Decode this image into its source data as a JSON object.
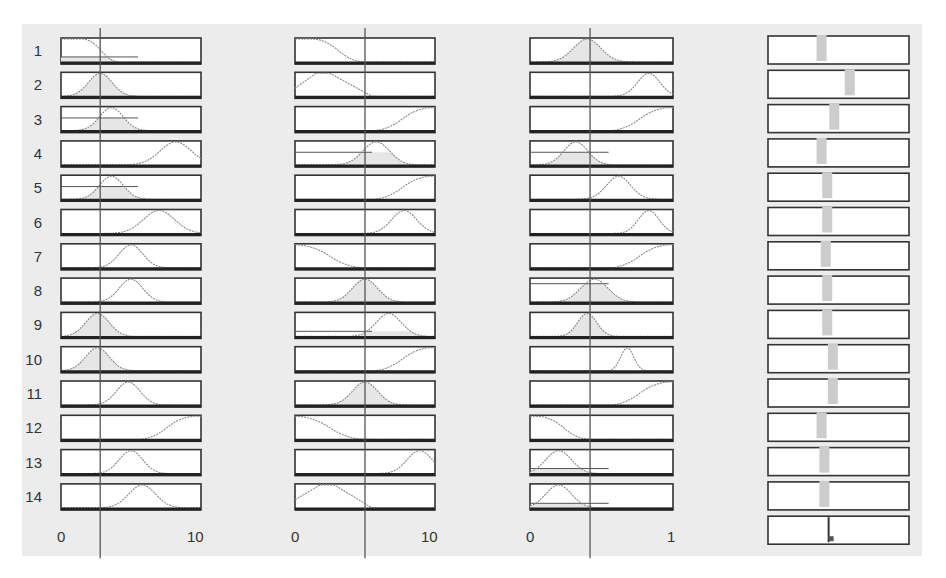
{
  "chart_data": {
    "type": "fuzzy-rule-viewer",
    "title": "",
    "rules": [
      "1",
      "2",
      "3",
      "4",
      "5",
      "6",
      "7",
      "8",
      "9",
      "10",
      "11",
      "12",
      "13",
      "14"
    ],
    "inputs": [
      {
        "name": "input1",
        "range": [
          0,
          10
        ],
        "tick_labels": [
          "0",
          "10"
        ],
        "current_value": 2.8,
        "membership": [
          {
            "rule": 1,
            "shape": "zmf",
            "params": [
              0,
              1.5,
              4.2
            ],
            "fired": 0.22
          },
          {
            "rule": 2,
            "shape": "gauss",
            "center": 2.8,
            "width": 1.5,
            "fired": 1.0
          },
          {
            "rule": 3,
            "shape": "gauss",
            "center": 3.6,
            "width": 1.5,
            "fired": 0.55
          },
          {
            "rule": 4,
            "shape": "gauss",
            "center": 8.2,
            "width": 2.0,
            "fired": 0.0
          },
          {
            "rule": 5,
            "shape": "gauss",
            "center": 3.6,
            "width": 1.5,
            "fired": 0.55
          },
          {
            "rule": 6,
            "shape": "gauss",
            "center": 7.0,
            "width": 2.0,
            "fired": 0.0
          },
          {
            "rule": 7,
            "shape": "gauss",
            "center": 5.0,
            "width": 1.5,
            "fired": 0.0
          },
          {
            "rule": 8,
            "shape": "gauss",
            "center": 5.0,
            "width": 1.5,
            "fired": 0.0
          },
          {
            "rule": 9,
            "shape": "gauss",
            "center": 2.6,
            "width": 1.5,
            "fired": 1.0
          },
          {
            "rule": 10,
            "shape": "gauss",
            "center": 2.6,
            "width": 1.5,
            "fired": 1.0
          },
          {
            "rule": 11,
            "shape": "gauss",
            "center": 4.8,
            "width": 1.5,
            "fired": 0.0
          },
          {
            "rule": 12,
            "shape": "smf",
            "params": [
              5.5,
              9.6
            ],
            "fired": 0.0
          },
          {
            "rule": 13,
            "shape": "gauss",
            "center": 5.0,
            "width": 1.5,
            "fired": 0.0
          },
          {
            "rule": 14,
            "shape": "gauss",
            "center": 5.8,
            "width": 1.7,
            "fired": 0.0
          }
        ]
      },
      {
        "name": "input2",
        "range": [
          0,
          10
        ],
        "tick_labels": [
          "0",
          "10"
        ],
        "current_value": 5.0,
        "membership": [
          {
            "rule": 1,
            "shape": "zmf",
            "params": [
              1.2,
              5.0
            ],
            "fired": 0.0
          },
          {
            "rule": 2,
            "shape": "trap",
            "params": [
              0,
              1.5,
              2.5,
              5.5
            ],
            "fired": 0.0
          },
          {
            "rule": 3,
            "shape": "smf",
            "params": [
              5.5,
              9.8
            ],
            "fired": 0.0
          },
          {
            "rule": 4,
            "shape": "gauss",
            "center": 5.8,
            "width": 1.7,
            "fired": 0.55
          },
          {
            "rule": 5,
            "shape": "smf",
            "params": [
              5.5,
              9.8
            ],
            "fired": 0.0
          },
          {
            "rule": 6,
            "shape": "gauss",
            "center": 7.8,
            "width": 1.6,
            "fired": 0.0
          },
          {
            "rule": 7,
            "shape": "zmf",
            "params": [
              0,
              5.0
            ],
            "fired": 0.0
          },
          {
            "rule": 8,
            "shape": "gauss",
            "center": 5.0,
            "width": 1.6,
            "fired": 1.0
          },
          {
            "rule": 9,
            "shape": "gauss",
            "center": 6.7,
            "width": 1.6,
            "fired": 0.22
          },
          {
            "rule": 10,
            "shape": "smf",
            "params": [
              5.5,
              9.8
            ],
            "fired": 0.0
          },
          {
            "rule": 11,
            "shape": "gauss",
            "center": 5.0,
            "width": 1.6,
            "fired": 1.0
          },
          {
            "rule": 12,
            "shape": "zmf",
            "params": [
              0,
              5.0
            ],
            "fired": 0.0
          },
          {
            "rule": 13,
            "shape": "gauss",
            "center": 8.9,
            "width": 1.6,
            "fired": 0.0
          },
          {
            "rule": 14,
            "shape": "trap",
            "params": [
              0,
              1.8,
              2.8,
              5.5
            ],
            "fired": 0.0
          }
        ]
      },
      {
        "name": "input3",
        "range": [
          0,
          1
        ],
        "tick_labels": [
          "0",
          "1"
        ],
        "current_value": 0.42,
        "membership": [
          {
            "rule": 1,
            "shape": "gauss",
            "center": 0.4,
            "width": 0.17,
            "fired": 1.0
          },
          {
            "rule": 2,
            "shape": "gauss",
            "center": 0.83,
            "width": 0.14,
            "fired": 0.0
          },
          {
            "rule": 3,
            "shape": "smf",
            "params": [
              0.55,
              0.98
            ],
            "fired": 0.0
          },
          {
            "rule": 4,
            "shape": "gauss",
            "center": 0.32,
            "width": 0.15,
            "fired": 0.55
          },
          {
            "rule": 5,
            "shape": "gauss",
            "center": 0.62,
            "width": 0.15,
            "fired": 0.0
          },
          {
            "rule": 6,
            "shape": "gauss",
            "center": 0.83,
            "width": 0.13,
            "fired": 0.0
          },
          {
            "rule": 7,
            "shape": "smf",
            "params": [
              0.55,
              0.98
            ],
            "fired": 0.0
          },
          {
            "rule": 8,
            "shape": "gauss",
            "center": 0.45,
            "width": 0.17,
            "fired": 0.8
          },
          {
            "rule": 9,
            "shape": "gauss",
            "center": 0.4,
            "width": 0.12,
            "fired": 1.0
          },
          {
            "rule": 10,
            "shape": "gauss",
            "center": 0.68,
            "width": 0.08,
            "fired": 0.0
          },
          {
            "rule": 11,
            "shape": "smf",
            "params": [
              0.55,
              0.98
            ],
            "fired": 0.0
          },
          {
            "rule": 12,
            "shape": "zmf",
            "params": [
              0.05,
              0.42
            ],
            "fired": 0.0
          },
          {
            "rule": 13,
            "shape": "gauss",
            "center": 0.2,
            "width": 0.16,
            "fired": 0.22
          },
          {
            "rule": 14,
            "shape": "gauss",
            "center": 0.2,
            "width": 0.16,
            "fired": 0.2
          }
        ]
      }
    ],
    "output": {
      "name": "output1",
      "bar_positions": [
        0.38,
        0.58,
        0.47,
        0.38,
        0.42,
        0.42,
        0.41,
        0.42,
        0.42,
        0.46,
        0.46,
        0.38,
        0.4,
        0.4
      ],
      "aggregate_marker": 0.43
    },
    "axis_labels": {
      "input1": [
        "0",
        "10"
      ],
      "input2": [
        "0",
        "10"
      ],
      "input3": [
        "0",
        "1"
      ]
    },
    "grid": false,
    "legend": null
  }
}
